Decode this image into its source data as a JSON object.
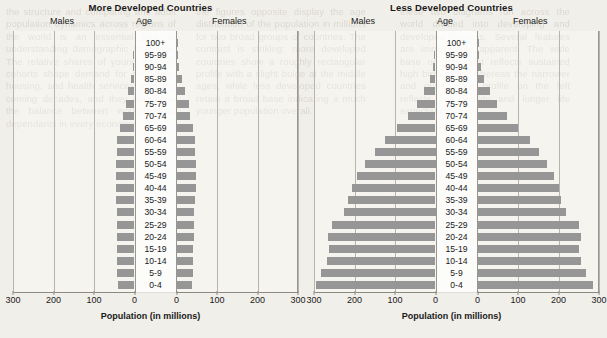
{
  "bleed_text": {
    "c1": "the structure and comparing and adult population dynamics across regions of the world is an essential part of understanding demographic transition. The relative shares of young and old cohorts shape demand for schooling, housing, and health services over the coming decades, and they determine the balance between workers and dependants in every economy.",
    "c2": "the figures opposite display the age distribution of the population in millions for two broad groups of countries. The contrast is striking: more developed countries show a roughly rectangular profile with a slight bulge at the middle ages, while less developed countries retain a broad base indicating a much younger population overall.",
    "c3": "these two diagrams run across the world divided into developing and developed regions. Several features are immediately apparent. The wide base on the right reflects sustained high birth rates, whereas the narrower and more even profile on the left reflects low fertility and longer life expectancy."
  },
  "xlabel": "Population (in millions)",
  "headers": {
    "males": "Males",
    "age": "Age",
    "females": "Females"
  },
  "colors": {
    "bar": "#969696",
    "grid": "#b8b4ac",
    "axis": "#8d8981"
  },
  "chart_data": [
    {
      "type": "bar",
      "title": "More Developed Countries",
      "subtype": "population-pyramid",
      "xlabel": "Population (in millions)",
      "ylabel": "Age",
      "xlim": [
        -300,
        300
      ],
      "xticks_left": [
        300,
        200,
        100,
        0
      ],
      "xticks_right": [
        0,
        100,
        200,
        300
      ],
      "grid": true,
      "legend": [
        "Males",
        "Females"
      ],
      "categories": [
        "100+",
        "95-99",
        "90-94",
        "85-89",
        "80-84",
        "75-79",
        "70-74",
        "65-69",
        "60-64",
        "55-59",
        "50-54",
        "45-49",
        "40-44",
        "35-39",
        "30-34",
        "25-29",
        "20-24",
        "15-19",
        "10-14",
        "5-9",
        "0-4"
      ],
      "series": [
        {
          "name": "Males",
          "values": [
            0,
            1,
            3,
            8,
            15,
            22,
            28,
            36,
            42,
            44,
            46,
            46,
            46,
            46,
            44,
            43,
            44,
            42,
            43,
            42,
            41
          ]
        },
        {
          "name": "Females",
          "values": [
            1,
            3,
            7,
            14,
            22,
            30,
            34,
            41,
            45,
            46,
            47,
            47,
            47,
            46,
            44,
            43,
            43,
            40,
            41,
            40,
            39
          ]
        }
      ]
    },
    {
      "type": "bar",
      "title": "Less Developed Countries",
      "subtype": "population-pyramid",
      "xlabel": "Population (in millions)",
      "ylabel": "Age",
      "xlim": [
        -300,
        300
      ],
      "xticks_left": [
        300,
        200,
        100,
        0
      ],
      "xticks_right": [
        0,
        100,
        200,
        300
      ],
      "grid": true,
      "legend": [
        "Males",
        "Females"
      ],
      "categories": [
        "100+",
        "95-99",
        "90-94",
        "85-89",
        "80-84",
        "75-79",
        "70-74",
        "65-69",
        "60-64",
        "55-59",
        "50-54",
        "45-49",
        "40-44",
        "35-39",
        "30-34",
        "25-29",
        "20-24",
        "15-19",
        "10-14",
        "5-9",
        "0-4"
      ],
      "series": [
        {
          "name": "Males",
          "values": [
            0,
            2,
            6,
            14,
            28,
            45,
            68,
            95,
            125,
            150,
            175,
            195,
            205,
            215,
            225,
            255,
            265,
            262,
            268,
            282,
            295
          ]
        },
        {
          "name": "Females",
          "values": [
            1,
            3,
            8,
            16,
            30,
            48,
            72,
            100,
            130,
            152,
            172,
            190,
            200,
            205,
            218,
            250,
            255,
            250,
            255,
            268,
            285
          ]
        }
      ]
    }
  ]
}
